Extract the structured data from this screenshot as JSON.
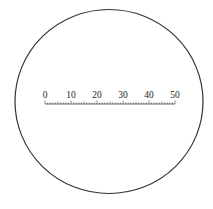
{
  "diagram": {
    "circle": {
      "cx": 109,
      "cy": 101.5,
      "rx": 94,
      "ry": 92,
      "stroke": "#333333"
    },
    "scale": {
      "labels": [
        "0",
        "10",
        "20",
        "30",
        "40",
        "50"
      ],
      "min": 0,
      "max": 50,
      "major_step": 10,
      "minor_step": 1,
      "x_start": 45,
      "x_end": 175,
      "y": 104
    },
    "caption": "..."
  }
}
